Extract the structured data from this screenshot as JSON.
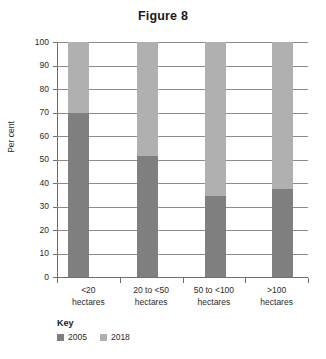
{
  "chart_data": {
    "type": "bar",
    "subtype": "stacked-100-percent",
    "title": "Figure 8",
    "xlabel": "",
    "ylabel": "Per cent",
    "ylim": [
      0,
      100
    ],
    "yticks": [
      0,
      10,
      20,
      30,
      40,
      50,
      60,
      70,
      80,
      90,
      100
    ],
    "ytick_labels": [
      "0",
      "10",
      "20",
      "30",
      "40",
      "50",
      "60",
      "70",
      "80",
      "90",
      "100"
    ],
    "grid": true,
    "legend_position": "bottom-left",
    "legend_title": "Key",
    "categories": [
      "<20 hectares",
      "20 to <50 hectares",
      "50 to <100 hectares",
      ">100 hectares"
    ],
    "category_lines": [
      [
        "<20",
        "hectares"
      ],
      [
        "20 to <50",
        "hectares"
      ],
      [
        "50 to <100",
        "hectares"
      ],
      [
        ">100",
        "hectares"
      ]
    ],
    "series": [
      {
        "name": "2005",
        "color": "#7f7f7f",
        "values": [
          70,
          51.5,
          34.5,
          37.5
        ]
      },
      {
        "name": "2018",
        "color": "#b0b0b0",
        "values": [
          30,
          48.5,
          65.5,
          62.5
        ]
      }
    ]
  },
  "colors": {
    "series_2005": "#7f7f7f",
    "series_2018": "#b0b0b0",
    "axis": "#6e6e6e",
    "grid": "#8c8c8c",
    "text": "#2b2b2b",
    "background": "#ffffff"
  }
}
